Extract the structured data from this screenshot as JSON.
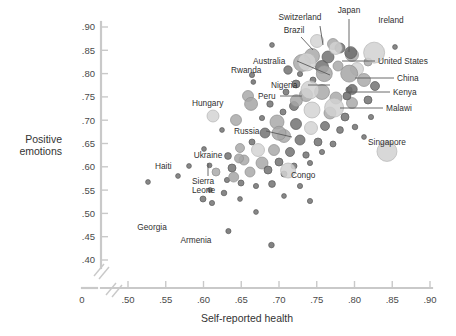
{
  "chart_data": {
    "type": "scatter",
    "title": "",
    "xlabel": "Self-reported health",
    "ylabel_line1": "Positive",
    "ylabel_line2": "emotions",
    "xlim": [
      0.47,
      0.9
    ],
    "ylim": [
      0.385,
      0.905
    ],
    "xticks": [
      "0",
      ".50",
      ".55",
      ".60",
      ".65",
      ".70",
      ".75",
      ".80",
      ".85",
      ".90"
    ],
    "xtick_values": [
      0.0,
      0.5,
      0.55,
      0.6,
      0.65,
      0.7,
      0.75,
      0.8,
      0.85,
      0.9
    ],
    "yticks": [
      ".90",
      ".85",
      ".80",
      ".75",
      ".70",
      ".65",
      ".60",
      ".55",
      ".50",
      ".45",
      ".40"
    ],
    "ytick_values": [
      0.9,
      0.85,
      0.8,
      0.75,
      0.7,
      0.65,
      0.6,
      0.55,
      0.5,
      0.45,
      0.4
    ],
    "axis_break": true,
    "grid": false,
    "legend": "none",
    "marker": "bubble, area scaled to population, translucent gray",
    "colors": {
      "axis": "#c9c9c9",
      "bubble_light": "#cfcfcf",
      "bubble_mid": "#a8a8a8",
      "bubble_dark": "#6f6f6f",
      "text": "#2f2f2f"
    },
    "labeled_points": [
      {
        "name": "Switzerland",
        "x": 0.775,
        "y": 0.855,
        "r": 6.5,
        "tone": "light"
      },
      {
        "name": "Japan",
        "x": 0.795,
        "y": 0.845,
        "r": 6.0,
        "tone": "dark"
      },
      {
        "name": "Ireland",
        "x": 0.826,
        "y": 0.845,
        "r": 10.5,
        "tone": "light"
      },
      {
        "name": "Brazil",
        "x": 0.737,
        "y": 0.825,
        "r": 9.0,
        "tone": "light"
      },
      {
        "name": "Australia",
        "x": 0.76,
        "y": 0.8,
        "r": 8.0,
        "tone": "mid"
      },
      {
        "name": "United States",
        "x": 0.793,
        "y": 0.8,
        "r": 8.5,
        "tone": "mid"
      },
      {
        "name": "Rwanda",
        "x": 0.666,
        "y": 0.782,
        "r": 2.4,
        "tone": "dark"
      },
      {
        "name": "Nigeria",
        "x": 0.741,
        "y": 0.765,
        "r": 9.0,
        "tone": "light"
      },
      {
        "name": "China",
        "x": 0.797,
        "y": 0.766,
        "r": 5.0,
        "tone": "dark"
      },
      {
        "name": "Kenya",
        "x": 0.79,
        "y": 0.752,
        "r": 4.0,
        "tone": "dark"
      },
      {
        "name": "Peru",
        "x": 0.723,
        "y": 0.742,
        "r": 6.0,
        "tone": "mid"
      },
      {
        "name": "Malawi",
        "x": 0.773,
        "y": 0.727,
        "r": 9.5,
        "tone": "light"
      },
      {
        "name": "Hungary",
        "x": 0.663,
        "y": 0.735,
        "r": 6.5,
        "tone": "mid"
      },
      {
        "name": "Russia",
        "x": 0.7,
        "y": 0.672,
        "r": 7.0,
        "tone": "mid"
      },
      {
        "name": "Singapore",
        "x": 0.843,
        "y": 0.633,
        "r": 10.0,
        "tone": "light"
      },
      {
        "name": "Ukraine",
        "x": 0.647,
        "y": 0.618,
        "r": 4.5,
        "tone": "mid"
      },
      {
        "name": "Haiti",
        "x": 0.608,
        "y": 0.603,
        "r": 2.4,
        "tone": "dark"
      },
      {
        "name": "Sierra Leone",
        "x": 0.64,
        "y": 0.578,
        "r": 5.0,
        "tone": "mid"
      },
      {
        "name": "Congo",
        "x": 0.712,
        "y": 0.592,
        "r": 7.5,
        "tone": "light"
      },
      {
        "name": "Georgia",
        "x": 0.633,
        "y": 0.462,
        "r": 2.6,
        "tone": "dark"
      },
      {
        "name": "Armenia",
        "x": 0.69,
        "y": 0.432,
        "r": 2.8,
        "tone": "dark"
      }
    ],
    "annotations": [
      {
        "label": "Switzerland",
        "tx": 300,
        "ty": 20,
        "anchor": "middle",
        "lx": 320,
        "ly": 26,
        "px": 323,
        "py": 45
      },
      {
        "label": "Japan",
        "tx": 349,
        "ty": 13,
        "anchor": "middle",
        "lx": 349,
        "ly": 19,
        "px": 349,
        "py": 52
      },
      {
        "label": "Ireland",
        "tx": 391,
        "ty": 23,
        "anchor": "middle",
        "lx": 0,
        "ly": 0,
        "px": 0,
        "py": 0
      },
      {
        "label": "Brazil",
        "tx": 294,
        "ty": 33,
        "anchor": "middle",
        "lx": 301,
        "ly": 37,
        "px": 313,
        "py": 50
      },
      {
        "label": "Australia",
        "tx": 253,
        "ty": 64,
        "anchor": "start",
        "lx": 297,
        "ly": 61,
        "px": 330,
        "py": 75
      },
      {
        "label": "United States",
        "tx": 378,
        "ty": 64,
        "anchor": "start",
        "lx": 375,
        "ly": 61,
        "px": 342,
        "py": 61
      },
      {
        "label": "Rwanda",
        "tx": 231,
        "ty": 73,
        "anchor": "start",
        "lx": 0,
        "ly": 0,
        "px": 0,
        "py": 0
      },
      {
        "label": "Nigeria",
        "tx": 271,
        "ty": 88,
        "anchor": "start",
        "lx": 308,
        "ly": 85,
        "px": 330,
        "py": 85
      },
      {
        "label": "China",
        "tx": 397,
        "ty": 81,
        "anchor": "start",
        "lx": 394,
        "ly": 78,
        "px": 355,
        "py": 78
      },
      {
        "label": "Kenya",
        "tx": 393,
        "ty": 95,
        "anchor": "start",
        "lx": 390,
        "ly": 92,
        "px": 348,
        "py": 92
      },
      {
        "label": "Peru",
        "tx": 258,
        "ty": 99,
        "anchor": "start",
        "lx": 280,
        "ly": 96,
        "px": 302,
        "py": 96
      },
      {
        "label": "Malawi",
        "tx": 386,
        "ty": 111,
        "anchor": "start",
        "lx": 383,
        "ly": 108,
        "px": 340,
        "py": 108
      },
      {
        "label": "Hungary",
        "tx": 192,
        "ty": 106,
        "anchor": "start",
        "lx": 0,
        "ly": 0,
        "px": 0,
        "py": 0
      },
      {
        "label": "Russia",
        "tx": 234,
        "ty": 134,
        "anchor": "start",
        "lx": 266,
        "ly": 131,
        "px": 292,
        "py": 137
      },
      {
        "label": "Singapore",
        "tx": 387,
        "ty": 145,
        "anchor": "middle",
        "lx": 0,
        "ly": 0,
        "px": 0,
        "py": 0
      },
      {
        "label": "Ukraine",
        "tx": 208,
        "ty": 158,
        "anchor": "middle",
        "lx": 208,
        "ly": 163,
        "px": 208,
        "py": 176
      },
      {
        "label": "Haiti",
        "tx": 155,
        "ty": 169,
        "anchor": "start",
        "lx": 0,
        "ly": 0,
        "px": 0,
        "py": 0
      },
      {
        "label": "Congo",
        "tx": 291,
        "ty": 178,
        "anchor": "start",
        "lx": 0,
        "ly": 0,
        "px": 0,
        "py": 0
      },
      {
        "label": "Georgia",
        "tx": 152,
        "ty": 230,
        "anchor": "middle",
        "lx": 0,
        "ly": 0,
        "px": 0,
        "py": 0
      },
      {
        "label": "Armenia",
        "tx": 196,
        "ty": 243,
        "anchor": "middle",
        "lx": 0,
        "ly": 0,
        "px": 0,
        "py": 0
      },
      {
        "label": "Sierra",
        "tx": 192,
        "ty": 184,
        "anchor": "start",
        "lx": 0,
        "ly": 0,
        "px": 0,
        "py": 0
      },
      {
        "label": "Leone",
        "tx": 192,
        "ty": 193,
        "anchor": "start",
        "lx": 0,
        "ly": 0,
        "px": 0,
        "py": 0
      }
    ],
    "unlabeled_points": [
      {
        "x": 272,
        "y": 45,
        "r": 2.4,
        "t": "d"
      },
      {
        "x": 395,
        "y": 47,
        "r": 2.4,
        "t": "d"
      },
      {
        "x": 252,
        "y": 75,
        "r": 2.6,
        "t": "d"
      },
      {
        "x": 288,
        "y": 70,
        "r": 4.2,
        "t": "d"
      },
      {
        "x": 300,
        "y": 74,
        "r": 2.6,
        "t": "d"
      },
      {
        "x": 317,
        "y": 41,
        "r": 6.5,
        "t": "l"
      },
      {
        "x": 333,
        "y": 44,
        "r": 5.5,
        "t": "m"
      },
      {
        "x": 312,
        "y": 56,
        "r": 7.5,
        "t": "m"
      },
      {
        "x": 328,
        "y": 57,
        "r": 6.0,
        "t": "d"
      },
      {
        "x": 340,
        "y": 48,
        "r": 5.0,
        "t": "d"
      },
      {
        "x": 352,
        "y": 55,
        "r": 6.5,
        "t": "m"
      },
      {
        "x": 302,
        "y": 63,
        "r": 8.5,
        "t": "m"
      },
      {
        "x": 322,
        "y": 67,
        "r": 6.5,
        "t": "d"
      },
      {
        "x": 338,
        "y": 66,
        "r": 5.0,
        "t": "m"
      },
      {
        "x": 357,
        "y": 69,
        "r": 6.5,
        "t": "l"
      },
      {
        "x": 368,
        "y": 62,
        "r": 4.0,
        "t": "m"
      },
      {
        "x": 364,
        "y": 80,
        "r": 6.5,
        "t": "m"
      },
      {
        "x": 375,
        "y": 86,
        "r": 4.5,
        "t": "d"
      },
      {
        "x": 349,
        "y": 90,
        "r": 3.2,
        "t": "d"
      },
      {
        "x": 313,
        "y": 80,
        "r": 3.0,
        "t": "d"
      },
      {
        "x": 296,
        "y": 84,
        "r": 4.0,
        "t": "d"
      },
      {
        "x": 286,
        "y": 92,
        "r": 3.0,
        "t": "d"
      },
      {
        "x": 306,
        "y": 95,
        "r": 6.5,
        "t": "m"
      },
      {
        "x": 322,
        "y": 92,
        "r": 7.5,
        "t": "m"
      },
      {
        "x": 336,
        "y": 98,
        "r": 6.0,
        "t": "m"
      },
      {
        "x": 352,
        "y": 103,
        "r": 5.5,
        "t": "m"
      },
      {
        "x": 368,
        "y": 100,
        "r": 4.0,
        "t": "d"
      },
      {
        "x": 294,
        "y": 106,
        "r": 4.5,
        "t": "d"
      },
      {
        "x": 312,
        "y": 110,
        "r": 8.0,
        "t": "l"
      },
      {
        "x": 330,
        "y": 113,
        "r": 6.0,
        "t": "m"
      },
      {
        "x": 345,
        "y": 117,
        "r": 4.0,
        "t": "d"
      },
      {
        "x": 283,
        "y": 112,
        "r": 3.0,
        "t": "d"
      },
      {
        "x": 270,
        "y": 104,
        "r": 3.2,
        "t": "d"
      },
      {
        "x": 262,
        "y": 118,
        "r": 2.6,
        "t": "d"
      },
      {
        "x": 277,
        "y": 122,
        "r": 7.0,
        "t": "m"
      },
      {
        "x": 296,
        "y": 124,
        "r": 5.5,
        "t": "d"
      },
      {
        "x": 311,
        "y": 128,
        "r": 6.5,
        "t": "l"
      },
      {
        "x": 325,
        "y": 126,
        "r": 4.5,
        "t": "d"
      },
      {
        "x": 340,
        "y": 130,
        "r": 3.4,
        "t": "d"
      },
      {
        "x": 355,
        "y": 127,
        "r": 2.8,
        "t": "d"
      },
      {
        "x": 265,
        "y": 133,
        "r": 5.0,
        "t": "d"
      },
      {
        "x": 284,
        "y": 136,
        "r": 6.5,
        "t": "m"
      },
      {
        "x": 300,
        "y": 140,
        "r": 5.0,
        "t": "d"
      },
      {
        "x": 318,
        "y": 142,
        "r": 4.0,
        "t": "d"
      },
      {
        "x": 333,
        "y": 144,
        "r": 3.0,
        "t": "d"
      },
      {
        "x": 252,
        "y": 142,
        "r": 3.0,
        "t": "d"
      },
      {
        "x": 240,
        "y": 148,
        "r": 4.5,
        "t": "m"
      },
      {
        "x": 258,
        "y": 150,
        "r": 6.5,
        "t": "l"
      },
      {
        "x": 274,
        "y": 150,
        "r": 5.5,
        "t": "m"
      },
      {
        "x": 290,
        "y": 152,
        "r": 4.5,
        "t": "d"
      },
      {
        "x": 306,
        "y": 155,
        "r": 3.2,
        "t": "d"
      },
      {
        "x": 322,
        "y": 152,
        "r": 2.6,
        "t": "d"
      },
      {
        "x": 228,
        "y": 156,
        "r": 3.4,
        "t": "d"
      },
      {
        "x": 244,
        "y": 160,
        "r": 5.0,
        "t": "m"
      },
      {
        "x": 262,
        "y": 163,
        "r": 6.0,
        "t": "m"
      },
      {
        "x": 279,
        "y": 162,
        "r": 4.0,
        "t": "d"
      },
      {
        "x": 294,
        "y": 166,
        "r": 3.0,
        "t": "d"
      },
      {
        "x": 310,
        "y": 163,
        "r": 2.6,
        "t": "d"
      },
      {
        "x": 232,
        "y": 168,
        "r": 4.0,
        "t": "d"
      },
      {
        "x": 250,
        "y": 172,
        "r": 5.0,
        "t": "m"
      },
      {
        "x": 268,
        "y": 170,
        "r": 4.0,
        "t": "d"
      },
      {
        "x": 284,
        "y": 174,
        "r": 3.0,
        "t": "d"
      },
      {
        "x": 216,
        "y": 172,
        "r": 4.0,
        "t": "m"
      },
      {
        "x": 227,
        "y": 180,
        "r": 2.6,
        "t": "d"
      },
      {
        "x": 241,
        "y": 183,
        "r": 3.0,
        "t": "d"
      },
      {
        "x": 256,
        "y": 186,
        "r": 2.6,
        "t": "d"
      },
      {
        "x": 272,
        "y": 184,
        "r": 3.4,
        "t": "d"
      },
      {
        "x": 300,
        "y": 186,
        "r": 2.6,
        "t": "d"
      },
      {
        "x": 210,
        "y": 190,
        "r": 2.4,
        "t": "d"
      },
      {
        "x": 224,
        "y": 193,
        "r": 2.8,
        "t": "d"
      },
      {
        "x": 203,
        "y": 199,
        "r": 3.0,
        "t": "d"
      },
      {
        "x": 212,
        "y": 203,
        "r": 2.6,
        "t": "d"
      },
      {
        "x": 240,
        "y": 199,
        "r": 2.4,
        "t": "d"
      },
      {
        "x": 284,
        "y": 196,
        "r": 2.4,
        "t": "d"
      },
      {
        "x": 310,
        "y": 201,
        "r": 2.6,
        "t": "d"
      },
      {
        "x": 256,
        "y": 212,
        "r": 2.4,
        "t": "d"
      },
      {
        "x": 148,
        "y": 182,
        "r": 2.4,
        "t": "d"
      },
      {
        "x": 178,
        "y": 176,
        "r": 2.4,
        "t": "d"
      },
      {
        "x": 189,
        "y": 166,
        "r": 2.4,
        "t": "d"
      },
      {
        "x": 204,
        "y": 149,
        "r": 2.4,
        "t": "d"
      },
      {
        "x": 222,
        "y": 130,
        "r": 2.4,
        "t": "d"
      },
      {
        "x": 236,
        "y": 120,
        "r": 5.5,
        "t": "m"
      },
      {
        "x": 213,
        "y": 116,
        "r": 6.0,
        "t": "l"
      },
      {
        "x": 248,
        "y": 96,
        "r": 5.5,
        "t": "m"
      },
      {
        "x": 371,
        "y": 117,
        "r": 2.6,
        "t": "d"
      },
      {
        "x": 364,
        "y": 137,
        "r": 2.4,
        "t": "d"
      }
    ]
  }
}
